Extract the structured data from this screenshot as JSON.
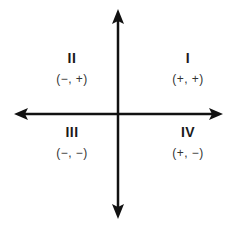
{
  "diagram": {
    "type": "cartesian-quadrants",
    "axis_color": "#111111",
    "text_color": "#1a1a1a",
    "quadrants": {
      "I": {
        "label": "I",
        "signs": "(+, +)"
      },
      "II": {
        "label": "II",
        "signs": "(−, +)"
      },
      "III": {
        "label": "III",
        "signs": "(−, −)"
      },
      "IV": {
        "label": "IV",
        "signs": "(+, −)"
      }
    },
    "axes": {
      "horizontal": {
        "arrows": "both"
      },
      "vertical": {
        "arrows": "both"
      }
    }
  }
}
